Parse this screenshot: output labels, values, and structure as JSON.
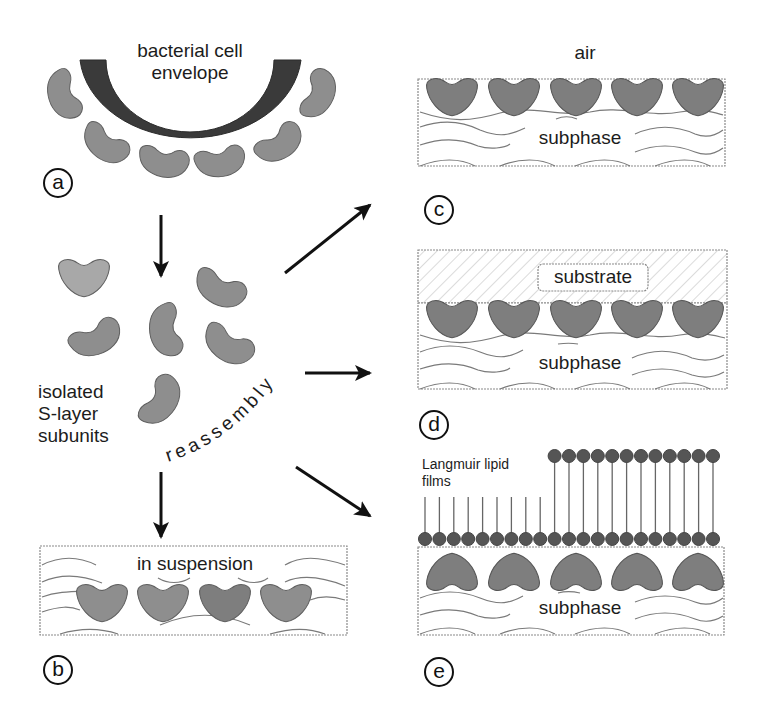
{
  "panel_a": {
    "letter": "a",
    "label_line1": "bacterial cell",
    "label_line2": "envelope"
  },
  "isolated": {
    "label_line1": "isolated",
    "label_line2": "S-layer",
    "label_line3": "subunits"
  },
  "process_label": "reassembly",
  "panel_b": {
    "letter": "b",
    "label": "in suspension"
  },
  "panel_c": {
    "letter": "c",
    "top_label": "air",
    "label": "subphase"
  },
  "panel_d": {
    "letter": "d",
    "substrate_label": "substrate",
    "label": "subphase"
  },
  "panel_e": {
    "letter": "e",
    "film_label_line1": "Langmuir lipid",
    "film_label_line2": "films",
    "label": "subphase"
  },
  "colors": {
    "envelope": "#3a3a3a",
    "subunit_fill": "#8e8e8e",
    "subunit_dark": "#6f6f6f",
    "subunit_light": "#b4b4b4",
    "wave": "#7a7a7a",
    "lipid_head": "#555555",
    "arrow": "#111111"
  }
}
